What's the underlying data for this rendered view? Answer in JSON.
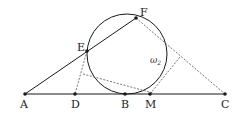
{
  "diagram": {
    "points": {
      "A": {
        "label": "A",
        "x": 25,
        "y": 94
      },
      "D": {
        "label": "D",
        "x": 75,
        "y": 94
      },
      "B": {
        "label": "B",
        "x": 125,
        "y": 94
      },
      "M": {
        "label": "M",
        "x": 150,
        "y": 94
      },
      "C": {
        "label": "C",
        "x": 225,
        "y": 94
      },
      "E": {
        "label": "E",
        "x": 87,
        "y": 51
      },
      "F": {
        "label": "F",
        "x": 136,
        "y": 18
      }
    },
    "circle": {
      "label": "ω",
      "subscript": "2",
      "cx": 127,
      "cy": 54,
      "r": 40
    },
    "colors": {
      "stroke": "#1a1a1a",
      "dashed": "#555555"
    }
  }
}
